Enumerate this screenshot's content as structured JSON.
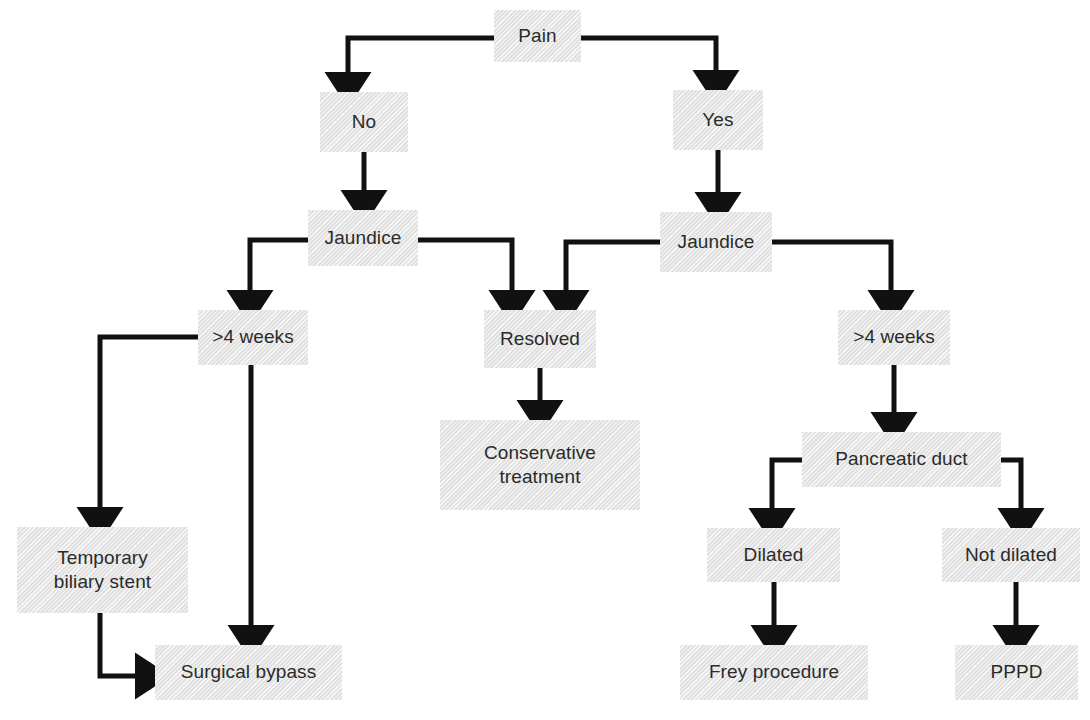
{
  "diagram": {
    "type": "flowchart",
    "orientation": "top-down",
    "box_fill": "#e4e4e4",
    "text_color": "#2b2b2b",
    "edge_color": "#111111",
    "nodes": [
      {
        "id": "pain",
        "label": "Pain",
        "x": 494,
        "y": 10,
        "w": 87,
        "h": 52
      },
      {
        "id": "no",
        "label": "No",
        "x": 320,
        "y": 92,
        "w": 88,
        "h": 60
      },
      {
        "id": "yes",
        "label": "Yes",
        "x": 673,
        "y": 90,
        "w": 90,
        "h": 60
      },
      {
        "id": "jaundice-left",
        "label": "Jaundice",
        "x": 308,
        "y": 210,
        "w": 110,
        "h": 56
      },
      {
        "id": "jaundice-right",
        "label": "Jaundice",
        "x": 660,
        "y": 212,
        "w": 112,
        "h": 60
      },
      {
        "id": "weeks-left",
        "label": ">4 weeks",
        "x": 198,
        "y": 310,
        "w": 110,
        "h": 55
      },
      {
        "id": "resolved",
        "label": "Resolved",
        "x": 484,
        "y": 310,
        "w": 112,
        "h": 58
      },
      {
        "id": "weeks-right",
        "label": ">4 weeks",
        "x": 838,
        "y": 310,
        "w": 112,
        "h": 55
      },
      {
        "id": "conservative",
        "label": "Conservative\ntreatment",
        "x": 440,
        "y": 420,
        "w": 200,
        "h": 90
      },
      {
        "id": "pancreatic-duct",
        "label": "Pancreatic duct",
        "x": 802,
        "y": 432,
        "w": 199,
        "h": 55
      },
      {
        "id": "temporary-stent",
        "label": "Temporary\nbiliary stent",
        "x": 17,
        "y": 527,
        "w": 171,
        "h": 86
      },
      {
        "id": "dilated",
        "label": "Dilated",
        "x": 707,
        "y": 528,
        "w": 133,
        "h": 54
      },
      {
        "id": "not-dilated",
        "label": "Not dilated",
        "x": 942,
        "y": 528,
        "w": 138,
        "h": 54
      },
      {
        "id": "surgical-bypass",
        "label": "Surgical bypass",
        "x": 155,
        "y": 645,
        "w": 187,
        "h": 55
      },
      {
        "id": "frey",
        "label": "Frey procedure",
        "x": 680,
        "y": 645,
        "w": 188,
        "h": 55
      },
      {
        "id": "pppd",
        "label": "PPPD",
        "x": 955,
        "y": 645,
        "w": 123,
        "h": 55
      }
    ],
    "edges": [
      {
        "id": "pain-to-no",
        "from": "pain",
        "to": "no",
        "kind": "elbow-left"
      },
      {
        "id": "pain-to-yes",
        "from": "pain",
        "to": "yes",
        "kind": "elbow-right"
      },
      {
        "id": "no-to-jaundice-left",
        "from": "no",
        "to": "jaundice-left",
        "kind": "straight-down"
      },
      {
        "id": "yes-to-jaundice-right",
        "from": "yes",
        "to": "jaundice-right",
        "kind": "straight-down"
      },
      {
        "id": "jaundice-left-to-weeks",
        "from": "jaundice-left",
        "to": "weeks-left",
        "kind": "elbow-left"
      },
      {
        "id": "jaundice-left-to-resolved",
        "from": "jaundice-left",
        "to": "resolved",
        "kind": "elbow-right"
      },
      {
        "id": "jaundice-right-to-resolved",
        "from": "jaundice-right",
        "to": "resolved",
        "kind": "elbow-left"
      },
      {
        "id": "jaundice-right-to-weeks",
        "from": "jaundice-right",
        "to": "weeks-right",
        "kind": "elbow-right"
      },
      {
        "id": "weeks-left-to-stent",
        "from": "weeks-left",
        "to": "temporary-stent",
        "kind": "elbow-left-long"
      },
      {
        "id": "weeks-left-to-bypass",
        "from": "weeks-left",
        "to": "surgical-bypass",
        "kind": "straight-down-long"
      },
      {
        "id": "resolved-to-conservative",
        "from": "resolved",
        "to": "conservative",
        "kind": "straight-down"
      },
      {
        "id": "weeks-right-to-duct",
        "from": "weeks-right",
        "to": "pancreatic-duct",
        "kind": "straight-down"
      },
      {
        "id": "stent-to-bypass",
        "from": "temporary-stent",
        "to": "surgical-bypass",
        "kind": "elbow-down-right"
      },
      {
        "id": "duct-to-dilated",
        "from": "pancreatic-duct",
        "to": "dilated",
        "kind": "elbow-left"
      },
      {
        "id": "duct-to-not-dilated",
        "from": "pancreatic-duct",
        "to": "not-dilated",
        "kind": "elbow-right"
      },
      {
        "id": "dilated-to-frey",
        "from": "dilated",
        "to": "frey",
        "kind": "straight-down"
      },
      {
        "id": "not-dilated-to-pppd",
        "from": "not-dilated",
        "to": "pppd",
        "kind": "straight-down"
      }
    ]
  }
}
